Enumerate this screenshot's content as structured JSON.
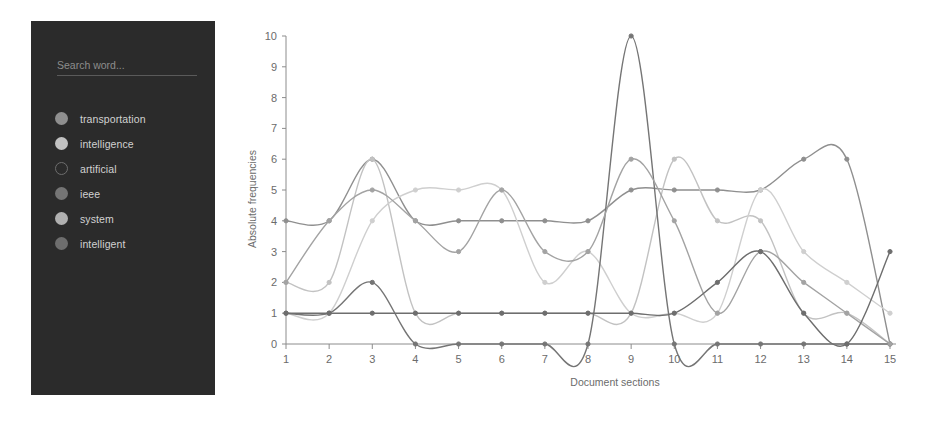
{
  "sidebar": {
    "search": {
      "placeholder": "Search word...",
      "value": ""
    },
    "legend_items": [
      {
        "label": "transportation",
        "color": "#8f8f8f",
        "hollow": false
      },
      {
        "label": "intelligence",
        "color": "#c2c2c2",
        "hollow": false
      },
      {
        "label": "artificial",
        "color": "#3a3a3a",
        "hollow": true
      },
      {
        "label": "ieee",
        "color": "#757575",
        "hollow": false
      },
      {
        "label": "system",
        "color": "#b0b0b0",
        "hollow": false
      },
      {
        "label": "intelligent",
        "color": "#6e6e6e",
        "hollow": false
      }
    ]
  },
  "chart_data": {
    "type": "line",
    "title": "",
    "xlabel": "Document sections",
    "ylabel": "Absolute frequencies",
    "categories": [
      "1",
      "2",
      "3",
      "4",
      "5",
      "6",
      "7",
      "8",
      "9",
      "10",
      "11",
      "12",
      "13",
      "14",
      "15"
    ],
    "x": [
      1,
      2,
      3,
      4,
      5,
      6,
      7,
      8,
      9,
      10,
      11,
      12,
      13,
      14,
      15
    ],
    "xlim": [
      1,
      15
    ],
    "ylim": [
      0,
      10
    ],
    "yticks": [
      0,
      1,
      2,
      3,
      4,
      5,
      6,
      7,
      8,
      9,
      10
    ],
    "grid": false,
    "legend_position": "left-sidebar",
    "interpolation": "smooth",
    "series": [
      {
        "name": "transportation",
        "color": "#8f8f8f",
        "values": [
          4,
          4,
          6,
          4,
          4,
          4,
          4,
          4,
          5,
          5,
          5,
          5,
          6,
          6,
          0
        ]
      },
      {
        "name": "intelligence",
        "color": "#c2c2c2",
        "values": [
          2,
          2,
          6,
          1,
          1,
          1,
          1,
          1,
          1,
          6,
          4,
          4,
          1,
          1,
          0
        ]
      },
      {
        "name": "artificial",
        "color": "#cfcfcf",
        "values": [
          1,
          1,
          4,
          5,
          5,
          5,
          2,
          3,
          1,
          1,
          1,
          5,
          3,
          2,
          1
        ]
      },
      {
        "name": "ieee",
        "color": "#757575",
        "values": [
          1,
          1,
          2,
          0,
          0,
          0,
          0,
          0,
          10,
          0,
          0,
          0,
          0,
          0,
          0
        ]
      },
      {
        "name": "system",
        "color": "#a3a3a3",
        "values": [
          2,
          4,
          5,
          4,
          3,
          5,
          3,
          3,
          6,
          4,
          1,
          3,
          2,
          1,
          0
        ]
      },
      {
        "name": "intelligent",
        "color": "#6e6e6e",
        "values": [
          1,
          1,
          1,
          1,
          1,
          1,
          1,
          1,
          1,
          1,
          2,
          3,
          1,
          0,
          3
        ]
      }
    ]
  }
}
